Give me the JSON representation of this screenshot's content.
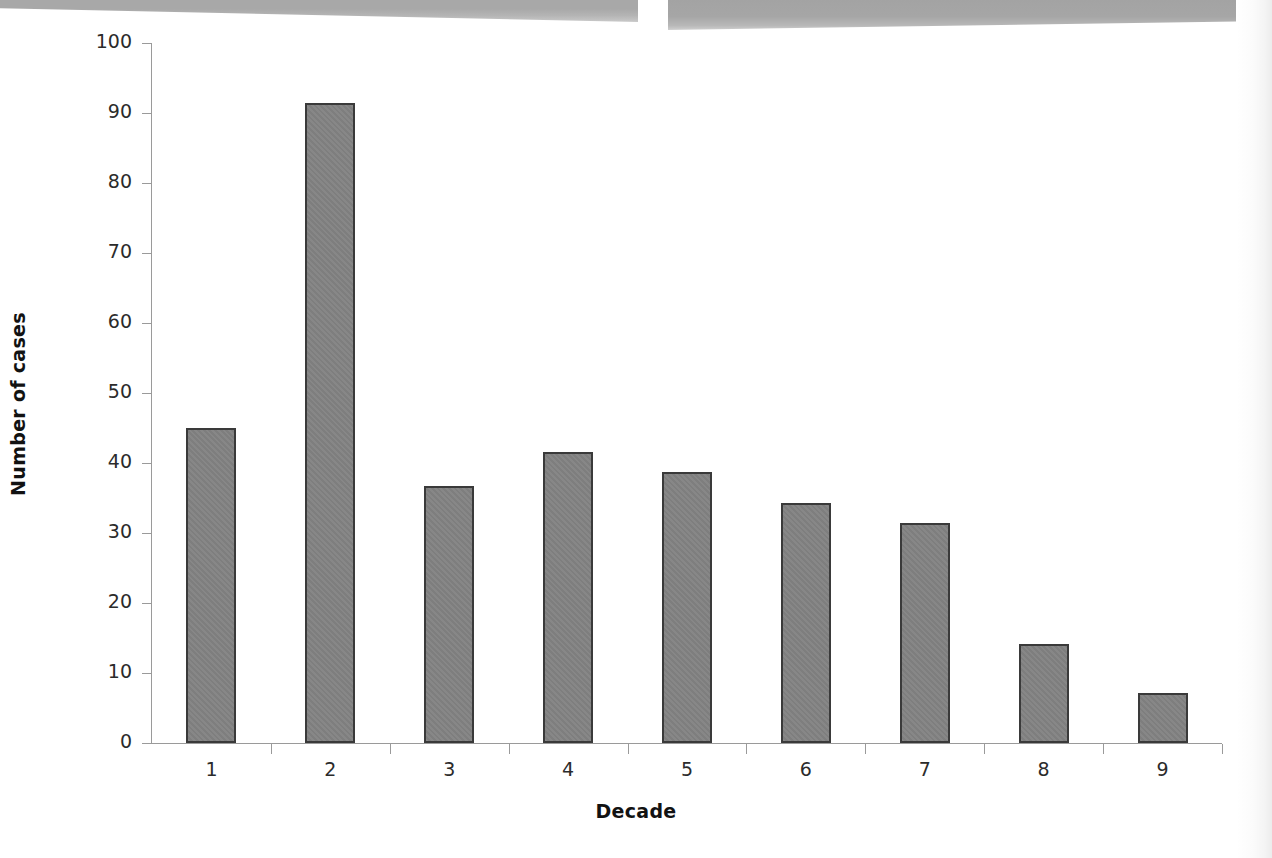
{
  "document": {
    "type": "scanned-figure",
    "background_color": "#ffffff"
  },
  "scan_artifacts": {
    "left_band_color": "#a8a8a8",
    "right_band_color": "#a3a3a3"
  },
  "chart_data": {
    "type": "bar",
    "title": "",
    "xlabel": "Decade",
    "ylabel": "Number of cases",
    "categories": [
      "1",
      "2",
      "3",
      "4",
      "5",
      "6",
      "7",
      "8",
      "9"
    ],
    "values": [
      45,
      91.5,
      36.7,
      41.6,
      38.7,
      34.3,
      31.4,
      14.1,
      7.1
    ],
    "ylim": [
      0,
      100
    ],
    "yticks": [
      0,
      10,
      20,
      30,
      40,
      50,
      60,
      70,
      80,
      90,
      100
    ],
    "ytick_labels": [
      "0",
      "10",
      "20",
      "30",
      "40",
      "50",
      "60",
      "70",
      "80",
      "90",
      "100"
    ],
    "grid": false,
    "legend": null,
    "bar_fill_color": "#828282",
    "bar_border_color": "#3a3a3a",
    "axis_color": "#9a9a9a"
  }
}
